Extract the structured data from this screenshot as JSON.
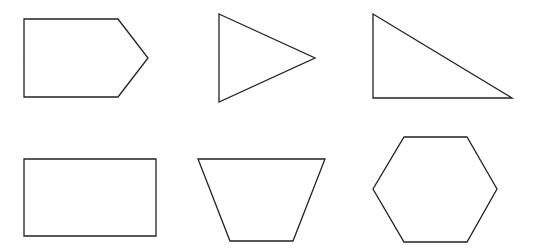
{
  "canvas": {
    "width": 533,
    "height": 250,
    "background": "#ffffff"
  },
  "stroke": {
    "color": "#222222",
    "width": 1.3
  },
  "shapes": [
    {
      "name": "pentagon-arrow",
      "points": "24,19 118,19 148,58 118,97 24,97"
    },
    {
      "name": "isosceles-triangle",
      "points": "219,14 315,58 219,102"
    },
    {
      "name": "right-triangle",
      "points": "373,14 512,98 373,98"
    },
    {
      "name": "rectangle",
      "points": "24,159 156,159 156,236 24,236"
    },
    {
      "name": "trapezoid",
      "points": "198,159 325,159 293,241 230,241"
    },
    {
      "name": "hexagon",
      "points": "404,137 467,137 497,189 467,242 404,242 373,189"
    }
  ]
}
